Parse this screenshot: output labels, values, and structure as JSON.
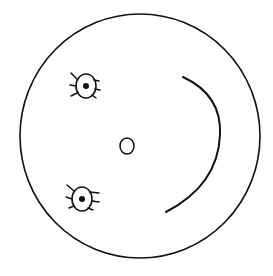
{
  "drawing": {
    "subject": "hand-drawn smiley face, rotated 90 degrees",
    "stroke_color": "#111111",
    "background_color": "#ffffff",
    "head": {
      "cx": 140,
      "cy": 136,
      "rx": 120,
      "ry": 122
    },
    "eyes": [
      {
        "name": "eye-upper",
        "cx": 86,
        "cy": 86,
        "rx": 10,
        "ry": 12
      },
      {
        "name": "eye-lower",
        "cx": 82,
        "cy": 199,
        "rx": 10,
        "ry": 12
      }
    ],
    "nose": {
      "cx": 127,
      "cy": 146,
      "rx": 7,
      "ry": 8
    },
    "smile": {
      "path": "M183,77 Q222,95 220,135 Q218,185 166,212"
    }
  }
}
